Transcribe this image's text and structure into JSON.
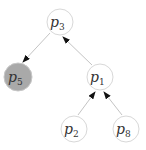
{
  "diagram": {
    "type": "tree",
    "colors": {
      "node_fill": "#ffffff",
      "node_stroke": "#d8d8d8",
      "highlight_fill": "#a9a9a9",
      "edge": "#c4c4c4",
      "arrow": "#111111",
      "text": "#333333"
    },
    "nodes": [
      {
        "id": "p3",
        "base": "p",
        "sub": "3",
        "highlighted": false
      },
      {
        "id": "p5",
        "base": "p",
        "sub": "5",
        "highlighted": true
      },
      {
        "id": "p1",
        "base": "p",
        "sub": "1",
        "highlighted": false
      },
      {
        "id": "p2",
        "base": "p",
        "sub": "2",
        "highlighted": false
      },
      {
        "id": "p8",
        "base": "p",
        "sub": "8",
        "highlighted": false
      }
    ],
    "edges": [
      {
        "from": "p3",
        "to": "p5"
      },
      {
        "from": "p1",
        "to": "p3"
      },
      {
        "from": "p2",
        "to": "p1"
      },
      {
        "from": "p8",
        "to": "p1"
      }
    ]
  }
}
